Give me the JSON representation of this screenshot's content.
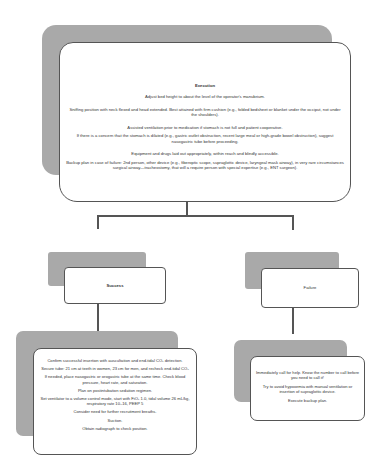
{
  "execution": {
    "title": "Execution",
    "items": [
      "Adjust bed height to about the level of the operator's manubrium.",
      "Sniffing position with neck flexed and head extended. Best attained with firm cushion (e.g., folded bedsheet or blanket under the occiput, not under the shoulders).",
      "Assisted ventilation prior to medication if stomach is not full and patient cooperative.",
      "If there is a concern that the stomach is dilated (e.g., gastric outlet obstruction, recent large meal or high-grade bowel obstruction), suggest nasogastric tube before proceeding.",
      "Equipment and drugs laid out appropriately, within reach and blindly accessible.",
      "Backup plan in case of failure: 2nd person, other device (e.g., fiberoptic scope, supraglottic device, laryngeal mask airway), in very rare circumstances surgical airway—tracheostomy, that will a require person with special expertise (e.g., ENT surgeon)."
    ]
  },
  "success": {
    "title": "Success",
    "items": [
      "Confirm successful insertion with auscultation and end-tidal CO₂ detection.",
      "Secure tube: 21 cm at teeth in women, 23 cm for men, and recheck end-tidal CO₂",
      "If needed, place nasogastric or orogastric tube at the same time. Check blood pressure, heart rate, and saturation.",
      "Plan on postintubation sedation regimen.",
      "Set ventilator to a volume control mode, start with FiO₂ 1.0, tidal volume 26 mL/kg, respiratory rate 10–16, PEEP 5",
      "Consider need for further recruitment breaths.",
      "Suction.",
      "Obtain radiograph to check position."
    ]
  },
  "failure": {
    "title": "Failure",
    "items": [
      "Immediately call for help.  Know the number to call before you need to call it!",
      "Try to avoid hypoxemia with manual ventilation or insertion of supraglottic device.",
      "Execute backup plan."
    ]
  },
  "colors": {
    "shadow": "#a9a9a9",
    "border": "#555555",
    "background": "#ffffff",
    "text": "#333333"
  }
}
